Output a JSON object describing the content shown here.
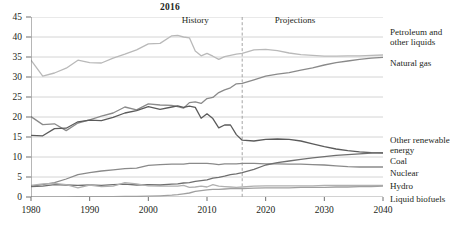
{
  "chart_data": {
    "type": "line",
    "title": "2016",
    "xlabel": "",
    "ylabel": "",
    "xlim": [
      1980,
      2040
    ],
    "ylim": [
      0,
      45
    ],
    "ytick_step": 5,
    "yticks": [
      0,
      5,
      10,
      15,
      20,
      25,
      30,
      35,
      40,
      45
    ],
    "xticks": [
      1980,
      1990,
      2000,
      2010,
      2020,
      2030,
      2040
    ],
    "grid": "horizontal",
    "legend_position": "right-of-axes",
    "annotations": [
      {
        "text": "History",
        "x": 2008,
        "y": 43.5
      },
      {
        "text": "Projections",
        "x": 2025,
        "y": 43.5
      },
      {
        "text": "2016",
        "x": 2016,
        "y": 46.5,
        "style": "bold-title"
      }
    ],
    "divider": {
      "x": 2016,
      "style": "dashed",
      "color": "#9a9a9a"
    },
    "x": [
      1980,
      1982,
      1984,
      1986,
      1988,
      1990,
      1992,
      1994,
      1996,
      1998,
      2000,
      2002,
      2004,
      2005,
      2006,
      2007,
      2008,
      2009,
      2010,
      2011,
      2012,
      2013,
      2014,
      2015,
      2016,
      2018,
      2020,
      2022,
      2024,
      2026,
      2028,
      2030,
      2032,
      2034,
      2036,
      2038,
      2040
    ],
    "series": [
      {
        "name": "Petroleum and other liquids",
        "color": "#b9b9b9",
        "values": [
          34.2,
          30.2,
          31.0,
          32.2,
          34.2,
          33.6,
          33.5,
          34.7,
          35.7,
          36.8,
          38.3,
          38.4,
          40.3,
          40.4,
          40.0,
          39.8,
          36.5,
          35.3,
          35.9,
          35.2,
          34.4,
          35.1,
          35.4,
          35.7,
          35.9,
          36.8,
          36.9,
          36.6,
          36.0,
          35.6,
          35.4,
          35.2,
          35.2,
          35.3,
          35.3,
          35.4,
          35.5
        ]
      },
      {
        "name": "Natural gas",
        "color": "#8a8a8a",
        "values": [
          20.1,
          18.1,
          18.3,
          16.6,
          18.5,
          19.3,
          20.2,
          21.0,
          22.5,
          21.8,
          23.3,
          23.0,
          22.9,
          22.6,
          22.2,
          23.6,
          23.8,
          23.4,
          24.6,
          24.9,
          26.1,
          26.8,
          27.3,
          28.3,
          28.4,
          29.3,
          30.2,
          30.7,
          31.1,
          31.7,
          32.3,
          33.0,
          33.6,
          34.0,
          34.4,
          34.7,
          34.9
        ]
      },
      {
        "name": "Coal",
        "color": "#5b5b5b",
        "values": [
          15.4,
          15.3,
          17.1,
          17.2,
          18.8,
          19.2,
          19.1,
          19.9,
          21.0,
          21.6,
          22.6,
          21.9,
          22.5,
          22.8,
          22.4,
          22.7,
          22.4,
          19.7,
          20.8,
          19.6,
          17.3,
          18.0,
          18.0,
          15.6,
          14.2,
          14.0,
          14.4,
          14.5,
          14.4,
          14.0,
          13.3,
          12.6,
          12.0,
          11.6,
          11.3,
          11.1,
          11.0
        ]
      },
      {
        "name": "Nuclear",
        "color": "#8a8a8a",
        "values": [
          2.7,
          3.1,
          3.6,
          4.5,
          5.6,
          6.1,
          6.5,
          6.8,
          7.1,
          7.2,
          7.9,
          8.1,
          8.2,
          8.2,
          8.2,
          8.4,
          8.4,
          8.4,
          8.4,
          8.3,
          8.1,
          8.3,
          8.3,
          8.3,
          8.4,
          8.4,
          8.3,
          8.3,
          8.2,
          8.2,
          8.1,
          8.0,
          7.8,
          7.6,
          7.5,
          7.5,
          7.5
        ]
      },
      {
        "name": "Other renewable energy",
        "color": "#6f6f6f",
        "values": [
          2.6,
          2.7,
          3.1,
          3.0,
          2.9,
          3.0,
          2.9,
          3.1,
          3.2,
          3.0,
          3.1,
          3.0,
          3.2,
          3.3,
          3.5,
          3.6,
          3.9,
          4.1,
          4.3,
          4.7,
          4.9,
          5.2,
          5.6,
          5.8,
          6.1,
          6.9,
          8.0,
          8.6,
          9.0,
          9.4,
          9.8,
          10.1,
          10.4,
          10.6,
          10.8,
          11.0,
          11.1
        ]
      },
      {
        "name": "Hydro",
        "color": "#b0b0b0",
        "values": [
          2.9,
          3.3,
          3.4,
          3.1,
          2.3,
          3.0,
          2.6,
          2.7,
          3.6,
          3.3,
          2.8,
          2.7,
          2.7,
          2.7,
          2.9,
          2.4,
          2.5,
          2.7,
          2.5,
          3.1,
          2.7,
          2.6,
          2.5,
          2.4,
          2.5,
          2.7,
          2.8,
          2.8,
          2.8,
          2.8,
          2.8,
          2.9,
          2.9,
          2.9,
          2.9,
          2.9,
          2.9
        ]
      },
      {
        "name": "Liquid biofuels",
        "color": "#a0a0a0",
        "values": [
          0.0,
          0.0,
          0.0,
          0.05,
          0.07,
          0.08,
          0.09,
          0.1,
          0.12,
          0.14,
          0.2,
          0.3,
          0.45,
          0.6,
          0.8,
          1.0,
          1.4,
          1.6,
          1.8,
          1.9,
          1.9,
          2.0,
          2.1,
          2.1,
          2.1,
          2.2,
          2.3,
          2.3,
          2.3,
          2.4,
          2.4,
          2.4,
          2.5,
          2.5,
          2.6,
          2.6,
          2.7
        ]
      }
    ]
  },
  "axis": {
    "ytick_labels": [
      "0",
      "5",
      "10",
      "15",
      "20",
      "25",
      "30",
      "35",
      "40",
      "45"
    ],
    "xtick_labels": [
      "1980",
      "1990",
      "2000",
      "2010",
      "2020",
      "2030",
      "2040"
    ]
  },
  "eras": {
    "history": "History",
    "projections": "Projections"
  },
  "labels": {
    "petroleum_line1": "Petroleum and",
    "petroleum_line2": "other liquids",
    "natural_gas": "Natural gas",
    "other_renewable_line1": "Other renewable",
    "other_renewable_line2": "energy",
    "coal": "Coal",
    "nuclear": "Nuclear",
    "hydro": "Hydro",
    "liquid_biofuels": "Liquid biofuels"
  }
}
